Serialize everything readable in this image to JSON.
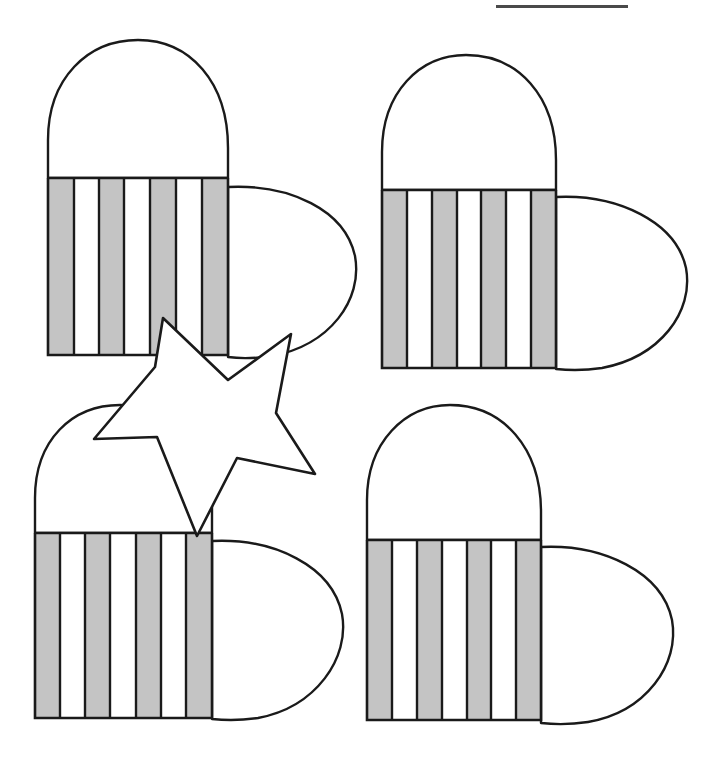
{
  "page": {
    "width": 724,
    "height": 761,
    "background_color": "#ffffff"
  },
  "style": {
    "outline_color": "#1a1a1a",
    "stripe_fill_color": "#c4c4c4",
    "shape_fill_color": "#ffffff",
    "star_fill_color": "#ffffff",
    "stroke_width": 2.4,
    "top_rule_color": "#4a4a4a"
  },
  "top_rule": {
    "label": "top-divider-rule",
    "x": 496,
    "y": 5,
    "width": 132,
    "height": 3,
    "color": "#4a4a4a"
  },
  "legend": {
    "stripe_sequence_label": "gray, white, gray, white, gray, white, gray",
    "stripe_count": 7,
    "gray_stripe_count": 4,
    "white_stripe_count": 3
  },
  "shapes": [
    {
      "id": "heart-top-left",
      "label": "Striped heart shape 1 (top left)",
      "position": "top-left",
      "dome": {
        "left": 48,
        "right": 228,
        "base_y": 178,
        "apex_x": 138,
        "apex_y": 40
      },
      "body": {
        "left": 48,
        "right": 228,
        "top": 178,
        "bottom": 355
      },
      "bulge": {
        "from_x": 228,
        "tip_x": 356,
        "top_y": 187,
        "bottom_y": 358,
        "mid_y": 272
      },
      "stripes": [
        "gray",
        "white",
        "gray",
        "white",
        "gray",
        "white",
        "gray"
      ],
      "stripe_count": 7,
      "stripe_edges": [
        48,
        74,
        99,
        124,
        150,
        176,
        202,
        228
      ]
    },
    {
      "id": "heart-top-right",
      "label": "Striped heart shape 2 (top right)",
      "position": "top-right",
      "dome": {
        "left": 382,
        "right": 556,
        "base_y": 190,
        "apex_x": 462,
        "apex_y": 55
      },
      "body": {
        "left": 382,
        "right": 556,
        "top": 190,
        "bottom": 368
      },
      "bulge": {
        "from_x": 556,
        "tip_x": 688,
        "top_y": 197,
        "bottom_y": 370,
        "mid_y": 284
      },
      "stripes": [
        "gray",
        "white",
        "gray",
        "white",
        "gray",
        "white",
        "gray"
      ],
      "stripe_count": 7,
      "stripe_edges": [
        382,
        407,
        432,
        457,
        481,
        506,
        531,
        556
      ]
    },
    {
      "id": "heart-bottom-left",
      "label": "Striped heart shape 3 (bottom left)",
      "position": "bottom-left",
      "dome": {
        "left": 35,
        "right": 212,
        "base_y": 533,
        "apex_x": 125,
        "apex_y": 405
      },
      "body": {
        "left": 35,
        "right": 212,
        "top": 533,
        "bottom": 718
      },
      "bulge": {
        "from_x": 212,
        "tip_x": 343,
        "top_y": 541,
        "bottom_y": 720,
        "mid_y": 630
      },
      "stripes": [
        "gray",
        "white",
        "gray",
        "white",
        "gray",
        "white",
        "gray"
      ],
      "stripe_count": 7,
      "stripe_edges": [
        35,
        60,
        85,
        110,
        136,
        161,
        186,
        212
      ]
    },
    {
      "id": "heart-bottom-right",
      "label": "Striped heart shape 4 (bottom right)",
      "position": "bottom-right",
      "dome": {
        "left": 367,
        "right": 541,
        "base_y": 540,
        "apex_x": 452,
        "apex_y": 405
      },
      "body": {
        "left": 367,
        "right": 541,
        "top": 540,
        "bottom": 720
      },
      "bulge": {
        "from_x": 541,
        "tip_x": 673,
        "top_y": 547,
        "bottom_y": 722,
        "mid_y": 634
      },
      "stripes": [
        "gray",
        "white",
        "gray",
        "white",
        "gray",
        "white",
        "gray"
      ],
      "stripe_count": 7,
      "stripe_edges": [
        367,
        392,
        417,
        442,
        467,
        491,
        516,
        541
      ]
    }
  ],
  "star": {
    "id": "star-overlay",
    "label": "Five-pointed star overlay",
    "points": 5,
    "fill": "#ffffff",
    "stroke": "#1a1a1a",
    "outer_vertices": [
      {
        "x": 163,
        "y": 318
      },
      {
        "x": 291,
        "y": 334
      },
      {
        "x": 315,
        "y": 474
      },
      {
        "x": 197,
        "y": 536
      },
      {
        "x": 94,
        "y": 439
      }
    ],
    "inner_vertices": [
      {
        "x": 228,
        "y": 380
      },
      {
        "x": 276,
        "y": 413
      },
      {
        "x": 237,
        "y": 458
      },
      {
        "x": 157,
        "y": 437
      },
      {
        "x": 155,
        "y": 367
      }
    ]
  }
}
